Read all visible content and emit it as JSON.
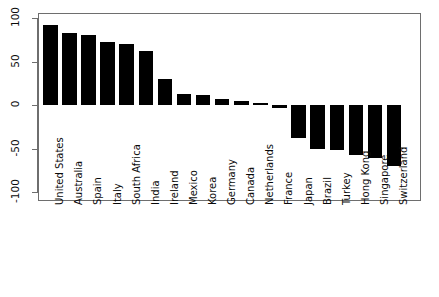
{
  "chart_data": {
    "type": "bar",
    "title": "",
    "subtitle": "",
    "xlabel": "",
    "ylabel": "",
    "orientation": "vertical",
    "bar_color": "#000000",
    "grid": false,
    "legend": false,
    "ylim": [
      -100,
      100
    ],
    "yticks": [
      100,
      50,
      0,
      -50,
      -100
    ],
    "ytick_labels": [
      "100",
      "50",
      "0",
      "-50",
      "-100"
    ],
    "categories": [
      "United States",
      "Australia",
      "Spain",
      "Italy",
      "South Africa",
      "India",
      "Ireland",
      "Mexico",
      "Korea",
      "Germany",
      "Canada",
      "Netherlands",
      "France",
      "Japan",
      "Brazil",
      "Turkey",
      "Hong Kong",
      "Singapore",
      "Switzerland"
    ],
    "values": [
      92,
      83,
      80,
      72,
      70,
      62,
      30,
      13,
      12,
      7,
      5,
      2,
      -3,
      -38,
      -50,
      -52,
      -57,
      -61,
      -70
    ]
  },
  "axes": {
    "y_axis_name": "y-axis",
    "x_axis_name": "x-axis",
    "frame_color": "#6e6e6e"
  }
}
